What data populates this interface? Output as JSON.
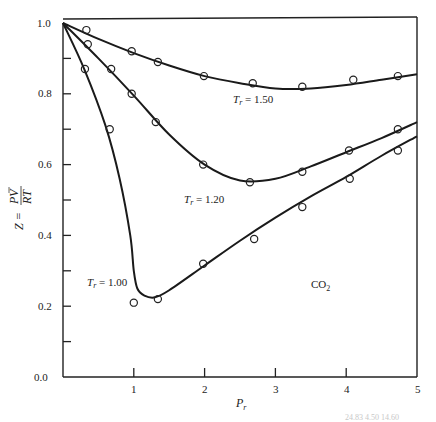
{
  "chart_data": {
    "type": "line",
    "title": "",
    "xlabel": "P_r",
    "ylabel": "Z = PV/RT",
    "xlim": [
      0,
      5
    ],
    "ylim": [
      0.0,
      1.0
    ],
    "x_ticks": [
      1,
      2,
      3,
      4,
      5
    ],
    "y_ticks_labeled": [
      0.0,
      0.2,
      0.4,
      0.6,
      0.8,
      1.0
    ],
    "y_ticks_minor": [
      0.1,
      0.3,
      0.5,
      0.7,
      0.9
    ],
    "grid": false,
    "legend": null,
    "annotations": [
      {
        "text": "T_r = 1.50",
        "x": 2.4,
        "y": 0.79
      },
      {
        "text": "T_r = 1.20",
        "x": 1.7,
        "y": 0.505
      },
      {
        "text": "T_r = 1.00",
        "x": 0.2,
        "y": 0.265
      },
      {
        "text": "CO2",
        "x": 3.45,
        "y": 0.25
      }
    ],
    "series": [
      {
        "name": "T_r = 1.50",
        "kind": "curve",
        "x": [
          0,
          0.5,
          1.0,
          1.5,
          2.0,
          2.5,
          3.0,
          3.5,
          4.0,
          4.5,
          5.0
        ],
        "y": [
          1.0,
          0.955,
          0.915,
          0.88,
          0.85,
          0.83,
          0.815,
          0.815,
          0.825,
          0.84,
          0.855
        ]
      },
      {
        "name": "T_r = 1.50 data",
        "kind": "points",
        "x": [
          0.33,
          0.97,
          1.34,
          1.99,
          2.68,
          3.38,
          4.1,
          4.73
        ],
        "y": [
          0.98,
          0.92,
          0.89,
          0.85,
          0.83,
          0.82,
          0.84,
          0.85
        ]
      },
      {
        "name": "T_r = 1.20",
        "kind": "curve",
        "x": [
          0,
          0.5,
          1.0,
          1.5,
          2.0,
          2.5,
          3.0,
          3.5,
          4.0,
          4.5,
          5.0
        ],
        "y": [
          1.0,
          0.9,
          0.795,
          0.685,
          0.6,
          0.555,
          0.56,
          0.595,
          0.635,
          0.675,
          0.72
        ]
      },
      {
        "name": "T_r = 1.20 data",
        "kind": "points",
        "x": [
          0.35,
          0.68,
          0.97,
          1.31,
          1.98,
          2.64,
          3.38,
          4.04,
          4.73
        ],
        "y": [
          0.94,
          0.87,
          0.8,
          0.72,
          0.6,
          0.55,
          0.58,
          0.64,
          0.7
        ]
      },
      {
        "name": "T_r = 1.00",
        "kind": "curve",
        "x": [
          0,
          0.3,
          0.6,
          0.8,
          0.95,
          1.0,
          1.05,
          1.15,
          1.3,
          1.5,
          2.0,
          2.5,
          3.0,
          3.5,
          4.0,
          4.5,
          5.0
        ],
        "y": [
          1.0,
          0.87,
          0.71,
          0.56,
          0.4,
          0.3,
          0.25,
          0.23,
          0.225,
          0.245,
          0.315,
          0.385,
          0.45,
          0.51,
          0.565,
          0.625,
          0.68
        ]
      },
      {
        "name": "T_r = 1.00 data",
        "kind": "points",
        "x": [
          0.31,
          0.66,
          1.0,
          1.34,
          1.98,
          2.7,
          3.38,
          4.05,
          4.73
        ],
        "y": [
          0.87,
          0.7,
          0.21,
          0.22,
          0.32,
          0.39,
          0.48,
          0.56,
          0.64
        ]
      }
    ]
  },
  "labels": {
    "y0": "0.0",
    "y2": "0.2",
    "y4": "0.4",
    "y6": "0.6",
    "y8": "0.8",
    "y10": "1.0",
    "x1": "1",
    "x2": "2",
    "x3": "3",
    "x4": "4",
    "x5": "5",
    "xaxis_main": "P",
    "xaxis_sub": "r",
    "yaxis_prefix": "Z = ",
    "yaxis_num": "PV",
    "yaxis_den": "RT",
    "tr150_main": "T",
    "tr150_sub": "r",
    "tr150_val": " = 1.50",
    "tr120_main": "T",
    "tr120_sub": "r",
    "tr120_val": " = 1.20",
    "tr100_main": "T",
    "tr100_sub": "r",
    "tr100_val": " = 1.00",
    "gas_main": "CO",
    "gas_sub": "2",
    "footer_fragment": "24.83 4.50      14.60"
  }
}
